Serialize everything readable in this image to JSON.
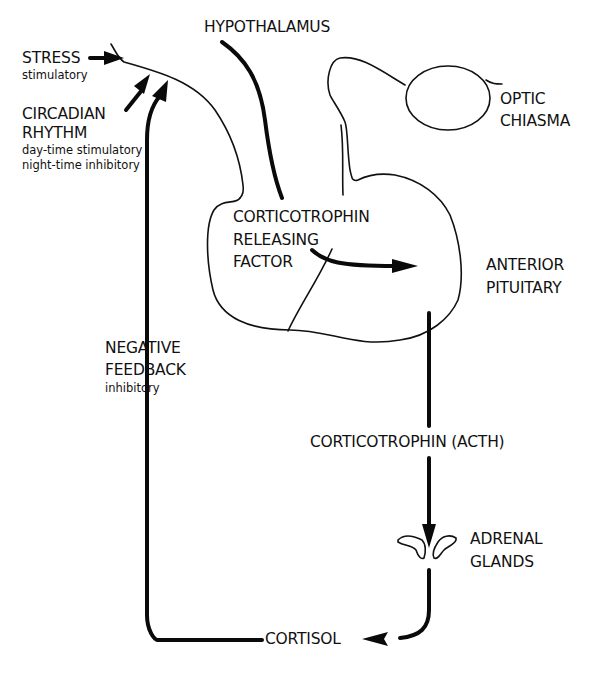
{
  "diagram": {
    "type": "physiology-feedback-loop",
    "colors": {
      "ink": "#111111",
      "background": "#ffffff"
    },
    "labels": {
      "hypothalamus": "HYPOTHALAMUS",
      "stress": {
        "title": "STRESS",
        "effect": "stimulatory"
      },
      "circadian": {
        "title_line1": "CIRCADIAN",
        "title_line2": "RHYTHM",
        "effect_line1": "day-time stimulatory",
        "effect_line2": "night-time inhibitory"
      },
      "optic_chiasma": {
        "line1": "OPTIC",
        "line2": "CHIASMA"
      },
      "crf": {
        "line1": "CORTICOTROPHIN",
        "line2": "RELEASING",
        "line3": "FACTOR"
      },
      "anterior_pituitary": {
        "line1": "ANTERIOR",
        "line2": "PITUITARY"
      },
      "negative_feedback": {
        "line1": "NEGATIVE",
        "line2": "FEEDBACK",
        "effect": "inhibitory"
      },
      "acth": "CORTICOTROPHIN (ACTH)",
      "adrenal_glands": {
        "line1": "ADRENAL",
        "line2": "GLANDS"
      },
      "cortisol": "CORTISOL"
    },
    "flows": [
      {
        "from": "STRESS",
        "to": "HYPOTHALAMUS",
        "effect": "stimulatory"
      },
      {
        "from": "CIRCADIAN RHYTHM",
        "to": "HYPOTHALAMUS",
        "effect": "day-time stimulatory / night-time inhibitory"
      },
      {
        "from": "HYPOTHALAMUS",
        "to": "ANTERIOR PITUITARY",
        "via": "CORTICOTROPHIN RELEASING FACTOR"
      },
      {
        "from": "ANTERIOR PITUITARY",
        "to": "ADRENAL GLANDS",
        "via": "CORTICOTROPHIN (ACTH)"
      },
      {
        "from": "ADRENAL GLANDS",
        "to": "CORTISOL"
      },
      {
        "from": "CORTISOL",
        "to": "HYPOTHALAMUS",
        "via": "NEGATIVE FEEDBACK",
        "effect": "inhibitory"
      }
    ]
  }
}
